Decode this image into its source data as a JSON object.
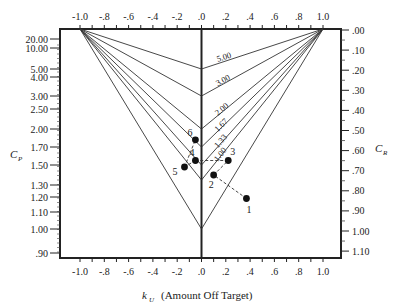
{
  "chart_data": {
    "type": "line",
    "title": "",
    "xlabel": "Amount Off Target",
    "xlabel_symbol": "k",
    "xlabel_subscript": "U",
    "ylabel_left_symbol": "C",
    "ylabel_left_subscript": "P",
    "ylabel_right_symbol": "C",
    "ylabel_right_subscript": "R",
    "xlim": [
      -1.15,
      1.15
    ],
    "x_ticks": [
      {
        "v": -1.0,
        "label": "-1.0"
      },
      {
        "v": -0.8,
        "label": "-.8"
      },
      {
        "v": -0.6,
        "label": "-.6"
      },
      {
        "v": -0.4,
        "label": "-.4"
      },
      {
        "v": -0.2,
        "label": "-.2"
      },
      {
        "v": 0.0,
        "label": ".0"
      },
      {
        "v": 0.2,
        "label": ".2"
      },
      {
        "v": 0.4,
        "label": ".4"
      },
      {
        "v": 0.6,
        "label": ".6"
      },
      {
        "v": 0.8,
        "label": ".8"
      },
      {
        "v": 1.0,
        "label": "1.0"
      }
    ],
    "left_axis_ticks": [
      {
        "v": 20.0,
        "label": "20.00"
      },
      {
        "v": 10.0,
        "label": "10.00"
      },
      {
        "v": 5.0,
        "label": "5.00"
      },
      {
        "v": 4.0,
        "label": "4.00"
      },
      {
        "v": 3.0,
        "label": "3.00"
      },
      {
        "v": 2.5,
        "label": "2.50"
      },
      {
        "v": 2.0,
        "label": "2.00"
      },
      {
        "v": 1.7,
        "label": "1.70"
      },
      {
        "v": 1.5,
        "label": "1.50"
      },
      {
        "v": 1.3,
        "label": "1.30"
      },
      {
        "v": 1.2,
        "label": "1.20"
      },
      {
        "v": 1.1,
        "label": "1.10"
      },
      {
        "v": 1.0,
        "label": "1.00"
      },
      {
        "v": 0.9,
        "label": ".90"
      }
    ],
    "right_axis_ticks": [
      {
        "v": 0.0,
        "label": ".00"
      },
      {
        "v": 0.1,
        "label": ".10"
      },
      {
        "v": 0.2,
        "label": ".20"
      },
      {
        "v": 0.3,
        "label": ".30"
      },
      {
        "v": 0.4,
        "label": ".40"
      },
      {
        "v": 0.5,
        "label": ".50"
      },
      {
        "v": 0.6,
        "label": ".60"
      },
      {
        "v": 0.7,
        "label": ".70"
      },
      {
        "v": 0.8,
        "label": ".80"
      },
      {
        "v": 0.9,
        "label": ".90"
      },
      {
        "v": 1.0,
        "label": "1.00"
      },
      {
        "v": 1.1,
        "label": "1.10"
      }
    ],
    "cpk_lines": [
      {
        "label": "5.00",
        "vertex_cp": 5.0
      },
      {
        "label": "3.00",
        "vertex_cp": 3.0
      },
      {
        "label": "2.00",
        "vertex_cp": 2.0
      },
      {
        "label": "1.67",
        "vertex_cp": 1.7
      },
      {
        "label": "1.33",
        "vertex_cp": 1.5
      },
      {
        "label": "1.00",
        "vertex_cp": 1.35
      },
      {
        "label": "",
        "vertex_cp": 1.0
      }
    ],
    "points": [
      {
        "label": "1",
        "k": 0.37,
        "cp": 1.19
      },
      {
        "label": "2",
        "k": 0.1,
        "cp": 1.4
      },
      {
        "label": "3",
        "k": 0.22,
        "cp": 1.55
      },
      {
        "label": "4",
        "k": -0.05,
        "cp": 1.55
      },
      {
        "label": "5",
        "k": -0.14,
        "cp": 1.48
      },
      {
        "label": "6",
        "k": -0.05,
        "cp": 1.82
      }
    ],
    "point_path_order": [
      "1",
      "2",
      "3",
      "4",
      "5",
      "6"
    ],
    "grid": false,
    "legend": "none"
  }
}
